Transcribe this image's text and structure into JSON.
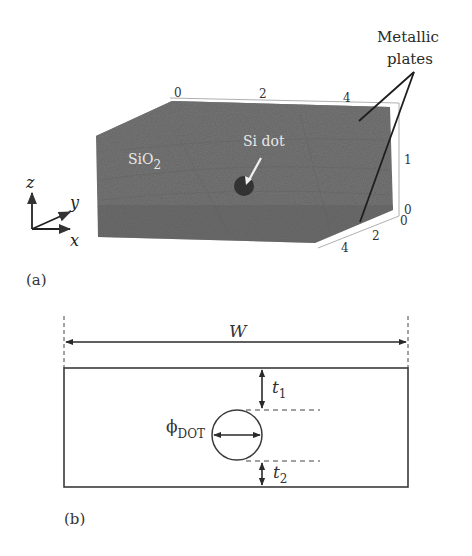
{
  "figure": {
    "panels": [
      {
        "id": "a",
        "label": "(a)",
        "description": "3D meshed SiO2 block containing Si dot between metallic plates",
        "material_label": "SiO",
        "material_subscript": "2",
        "dot_label": "Si dot",
        "callout_label_line1": "Metallic",
        "callout_label_line2": "plates",
        "axis_triad": {
          "z": "z",
          "y": "y",
          "x": "x"
        },
        "top_ticks": [
          "0",
          "2",
          "4"
        ],
        "depth_ticks": [
          "0",
          "2",
          "4"
        ],
        "height_ticks": [
          "0",
          "1"
        ],
        "colors": {
          "block": "#707070",
          "dot": "#2e2e2e",
          "inner_text": "#e8e8e8",
          "callout": "#1e1e1e"
        }
      },
      {
        "id": "b",
        "label": "(b)",
        "description": "Cross-section schematic with dot diameter and oxide thicknesses",
        "width_label": "W",
        "t1_label": "t",
        "t1_subscript": "1",
        "t2_label": "t",
        "t2_subscript": "2",
        "dot_diameter_label": "ϕ",
        "dot_diameter_subscript": "DOT",
        "colors": {
          "line": "#3a3a3a"
        }
      }
    ]
  }
}
